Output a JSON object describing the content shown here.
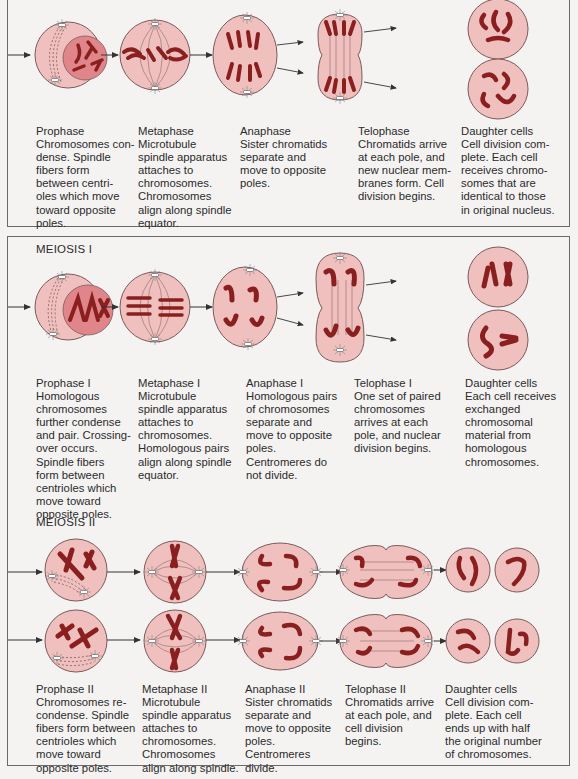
{
  "colors": {
    "cell_fill": "#f0c0bf",
    "cell_stroke": "#7a5a5a",
    "nucleus_fill": "#e0868a",
    "chromosome": "#8a1f1f",
    "frame": "#6a6a6a",
    "background": "#f4f3f2"
  },
  "mitosis": {
    "stages": [
      {
        "name": "Prophase",
        "text": "Chromosomes con-\ndense. Spindle\nfibers form\nbetween centri-\noles which move\ntoward opposite\npoles."
      },
      {
        "name": "Metaphase",
        "text": "Microtubule\nspindle apparatus\nattaches to\nchromosomes.\nChromosomes\nalign along spindle\nequator."
      },
      {
        "name": "Anaphase",
        "text": "Sister chromatids\nseparate and\nmove to opposite\npoles."
      },
      {
        "name": "Telophase",
        "text": "Chromatids arrive\nat each pole, and\nnew nuclear mem-\nbranes form. Cell\ndivision begins."
      },
      {
        "name": "Daughter cells",
        "text": "Cell division com-\nplete. Each cell\nreceives chromo-\nsomes that are\nidentical to those\nin original nucleus."
      }
    ]
  },
  "meiosis1": {
    "label": "MEIOSIS I",
    "stages": [
      {
        "name": "Prophase I",
        "text": "Homologous\nchromosomes\nfurther condense\nand pair. Crossing-\nover occurs.\nSpindle fibers\nform between\ncentrioles which\nmove toward\nopposite poles."
      },
      {
        "name": "Metaphase I",
        "text": "Microtubule\nspindle apparatus\nattaches to\nchromosomes.\nHomologous pairs\nalign along spindle\nequator."
      },
      {
        "name": "Anaphase I",
        "text": "Homologous pairs\nof chromosomes\nseparate and\nmove to opposite\npoles.\nCentromeres do\nnot divide."
      },
      {
        "name": "Telophase I",
        "text": "One set of paired\nchromosomes\narrives at each\npole, and nuclear\ndivision begins."
      },
      {
        "name": "Daughter cells",
        "text": "Each cell receives\nexchanged\nchromosomal\nmaterial from\nhomologous\nchromosomes."
      }
    ]
  },
  "meiosis2": {
    "label": "MEIOSIS II",
    "stages": [
      {
        "name": "Prophase II",
        "text": "Chromosomes re-\ncondense. Spindle\nfibers form between\ncentrioles which\nmove toward\nopposite poles."
      },
      {
        "name": "Metaphase II",
        "text": "Microtubule\nspindle apparatus\nattaches to\nchromosomes.\nChromosomes\nalign along spindle."
      },
      {
        "name": "Anaphase II",
        "text": "Sister chromatids\nseparate and\nmove to opposite\npoles.\nCentromeres\ndivide."
      },
      {
        "name": "Telophase II",
        "text": "Chromatids arrive\nat each pole, and\ncell division\nbegins."
      },
      {
        "name": "Daughter cells",
        "text": "Cell division com-\nplete. Each cell\nends up with half\nthe original number\nof chromosomes."
      }
    ]
  }
}
